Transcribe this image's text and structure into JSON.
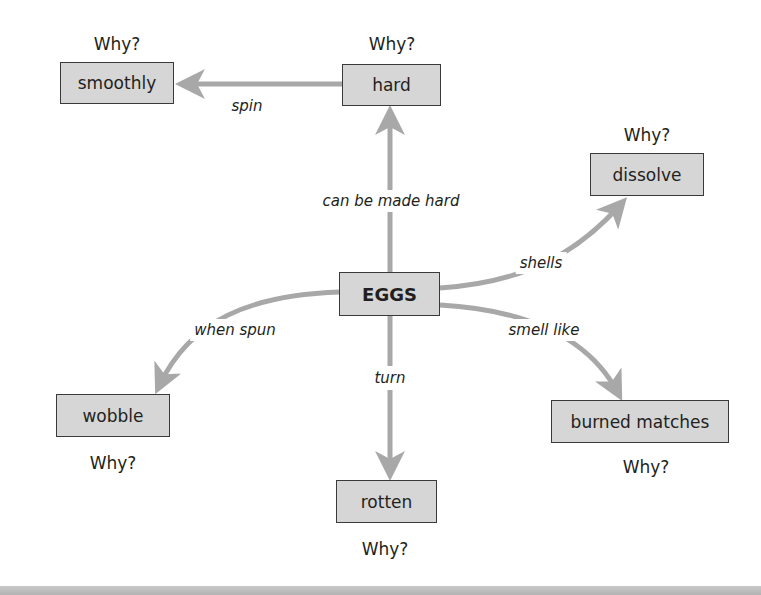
{
  "diagram": {
    "type": "concept-map",
    "central_node": "EGGS",
    "nodes": {
      "eggs": "EGGS",
      "hard": "hard",
      "smoothly": "smoothly",
      "dissolve": "dissolve",
      "wobble": "wobble",
      "rotten": "rotten",
      "burned_matches": "burned matches"
    },
    "why_prompts": {
      "hard": "Why?",
      "smoothly": "Why?",
      "dissolve": "Why?",
      "wobble": "Why?",
      "rotten": "Why?",
      "burned_matches": "Why?"
    },
    "links": {
      "eggs_hard": "can be made hard",
      "hard_smoothly": "spin",
      "eggs_dissolve": "shells",
      "eggs_burned_matches": "smell like",
      "eggs_wobble": "when spun",
      "eggs_rotten": "turn"
    },
    "edges": [
      {
        "from": "EGGS",
        "to": "hard",
        "label": "can be made hard"
      },
      {
        "from": "hard",
        "to": "smoothly",
        "label": "spin"
      },
      {
        "from": "EGGS",
        "to": "dissolve",
        "label": "shells"
      },
      {
        "from": "EGGS",
        "to": "burned matches",
        "label": "smell like"
      },
      {
        "from": "EGGS",
        "to": "wobble",
        "label": "when spun"
      },
      {
        "from": "EGGS",
        "to": "rotten",
        "label": "turn"
      }
    ],
    "colors": {
      "node_fill": "#d6d6d6",
      "node_border": "#3a3a3a",
      "arrow": "#a8a8a8",
      "text": "#231f20"
    }
  }
}
